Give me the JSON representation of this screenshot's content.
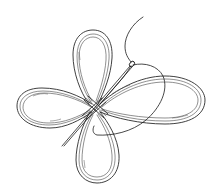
{
  "image": {
    "description": "Line drawing of a four-loop knot (butterfly/clover shape) made of a flat cord, with a sewing needle and thread passing through the center",
    "elements": [
      "top-loop",
      "left-loop",
      "right-loop",
      "bottom-loop",
      "center-crossing",
      "needle",
      "thread"
    ],
    "colors": {
      "background": "#ffffff",
      "ink": "#2a2a2a"
    }
  }
}
